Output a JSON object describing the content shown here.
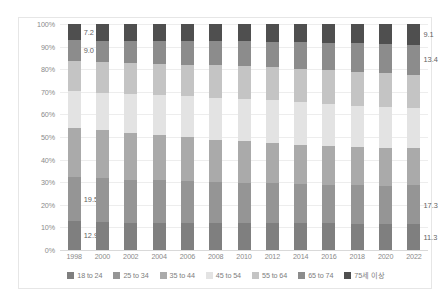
{
  "chart_data": {
    "type": "bar",
    "subtype": "stacked-100-percent-column",
    "title": "",
    "subtitle": "",
    "xlabel": "",
    "ylabel": "",
    "ylim": [
      0,
      100
    ],
    "ytick_labels": [
      "100%",
      "90%",
      "80%",
      "70%",
      "60%",
      "50%",
      "40%",
      "30%",
      "20%",
      "10%",
      "0%"
    ],
    "ytick_values": [
      100,
      90,
      80,
      70,
      60,
      50,
      40,
      30,
      20,
      10,
      0
    ],
    "grid": true,
    "grid_orientation": "horizontal",
    "legend_position": "bottom",
    "categories": [
      "1998",
      "2000",
      "2002",
      "2004",
      "2006",
      "2008",
      "2010",
      "2012",
      "2014",
      "2016",
      "2018",
      "2020",
      "2022"
    ],
    "series": [
      {
        "name": "18 to 24",
        "color": "#7f7f7f",
        "values": [
          12.9,
          12.5,
          12.1,
          12.2,
          12.2,
          12.2,
          12.3,
          12.3,
          12.2,
          12.0,
          11.8,
          11.5,
          11.3
        ]
      },
      {
        "name": "25 to 34",
        "color": "#959595",
        "values": [
          19.5,
          19.2,
          19.1,
          19.0,
          18.6,
          18.2,
          18.0,
          17.8,
          17.7,
          17.5,
          17.4,
          17.3,
          17.3
        ]
      },
      {
        "name": "35 to 44",
        "color": "#aaaaaa",
        "values": [
          21.6,
          21.3,
          20.8,
          20.2,
          19.6,
          19.0,
          18.6,
          18.0,
          17.6,
          17.2,
          17.0,
          16.8,
          16.6
        ]
      },
      {
        "name": "45 to 54",
        "color": "#e3e3e3",
        "values": [
          16.4,
          16.7,
          17.1,
          17.6,
          18.2,
          18.9,
          19.2,
          19.4,
          19.4,
          19.2,
          18.8,
          18.3,
          17.8
        ]
      },
      {
        "name": "55 to 64",
        "color": "#c4c4c4",
        "values": [
          13.6,
          13.7,
          13.8,
          14.0,
          14.2,
          14.4,
          14.6,
          14.8,
          15.0,
          15.2,
          15.3,
          15.4,
          14.5
        ]
      },
      {
        "name": "65 to 74",
        "color": "#8c8c8c",
        "values": [
          9.0,
          9.4,
          9.8,
          10.1,
          10.5,
          10.8,
          11.1,
          11.5,
          11.9,
          12.3,
          12.7,
          13.1,
          13.4
        ]
      },
      {
        "name": "75세 이상",
        "color": "#4f4f4f",
        "values": [
          7.2,
          7.3,
          7.4,
          7.5,
          7.6,
          7.7,
          7.8,
          8.0,
          8.2,
          8.5,
          8.7,
          8.9,
          9.1
        ]
      }
    ],
    "data_labels": {
      "1998": {
        "18 to 24": "12.9",
        "25 to 34": "19.5",
        "65 to 74": "9.0",
        "75세 이상": "7.2"
      },
      "2022": {
        "18 to 24": "11.3",
        "25 to 34": "17.3",
        "65 to 74": "13.4",
        "75세 이상": "9.1"
      }
    }
  },
  "legend": {
    "items": [
      {
        "label": "18 to 24",
        "color": "#7f7f7f"
      },
      {
        "label": "25 to 34",
        "color": "#959595"
      },
      {
        "label": "35 to 44",
        "color": "#aaaaaa"
      },
      {
        "label": "45 to 54",
        "color": "#e3e3e3"
      },
      {
        "label": "55 to 64",
        "color": "#c4c4c4"
      },
      {
        "label": "65 to 74",
        "color": "#8c8c8c"
      },
      {
        "label": "75세 이상",
        "color": "#4f4f4f"
      }
    ]
  }
}
